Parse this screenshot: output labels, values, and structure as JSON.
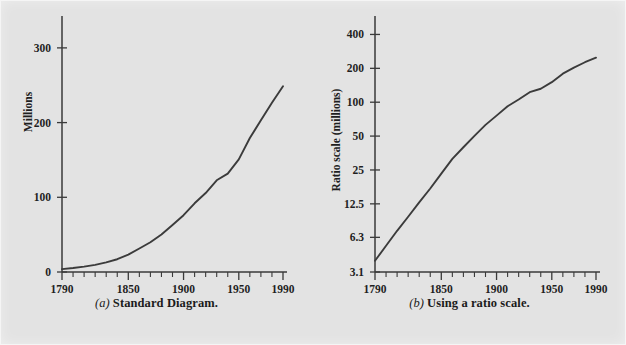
{
  "figure": {
    "background_color": "#e3e3e3",
    "line_color": "#3b3b3b",
    "axis_color": "#3a3a3a"
  },
  "panels": [
    {
      "id": "panel-a",
      "caption_letter": "(a)",
      "caption_text": "Standard Diagram.",
      "y_axis_title": "Millions",
      "y_tick_labels": [
        "0",
        "100",
        "200",
        "300"
      ],
      "x_tick_labels": [
        "1790",
        "1850",
        "1900",
        "1950",
        "1990"
      ]
    },
    {
      "id": "panel-b",
      "caption_letter": "(b)",
      "caption_text": "Using a ratio scale.",
      "y_axis_title": "Ratio scale (millions)",
      "y_tick_labels": [
        "3.1",
        "6.3",
        "12.5",
        "25",
        "50",
        "100",
        "200",
        "400"
      ],
      "x_tick_labels": [
        "1790",
        "1850",
        "1900",
        "1950",
        "1990"
      ]
    }
  ],
  "chart_data": [
    {
      "type": "line",
      "title": "Standard Diagram.",
      "subtitle": "(a)",
      "xlabel": "",
      "ylabel": "Millions",
      "yscale": "linear",
      "xlim": [
        1790,
        1990
      ],
      "ylim": [
        0,
        340
      ],
      "grid": false,
      "legend": "none",
      "x_ticks": [
        1790,
        1850,
        1900,
        1950,
        1990
      ],
      "x_minor_tick_step": 10,
      "y_ticks": [
        0,
        100,
        200,
        300
      ],
      "x": [
        1790,
        1800,
        1810,
        1820,
        1830,
        1840,
        1850,
        1860,
        1870,
        1880,
        1890,
        1900,
        1910,
        1920,
        1930,
        1940,
        1950,
        1960,
        1970,
        1980,
        1990
      ],
      "values": [
        3.9,
        5.3,
        7.2,
        9.6,
        12.9,
        17.1,
        23.2,
        31.4,
        39.8,
        50.2,
        62.9,
        76.0,
        92.0,
        105.7,
        122.8,
        131.7,
        150.7,
        179.3,
        203.2,
        226.5,
        248.7
      ]
    },
    {
      "type": "line",
      "title": "Using a ratio scale.",
      "subtitle": "(b)",
      "xlabel": "",
      "ylabel": "Ratio scale (millions)",
      "yscale": "log",
      "xlim": [
        1790,
        1990
      ],
      "ylim": [
        3.1,
        560
      ],
      "grid": false,
      "legend": "none",
      "x_ticks": [
        1790,
        1850,
        1900,
        1950,
        1990
      ],
      "x_minor_tick_step": 10,
      "y_ticks": [
        3.1,
        6.3,
        12.5,
        25,
        50,
        100,
        200,
        400
      ],
      "x": [
        1790,
        1800,
        1810,
        1820,
        1830,
        1840,
        1850,
        1860,
        1870,
        1880,
        1890,
        1900,
        1910,
        1920,
        1930,
        1940,
        1950,
        1960,
        1970,
        1980,
        1990
      ],
      "values": [
        3.9,
        5.3,
        7.2,
        9.6,
        12.9,
        17.1,
        23.2,
        31.4,
        39.8,
        50.2,
        62.9,
        76.0,
        92.0,
        105.7,
        122.8,
        131.7,
        150.7,
        179.3,
        203.2,
        226.5,
        248.7
      ]
    }
  ]
}
